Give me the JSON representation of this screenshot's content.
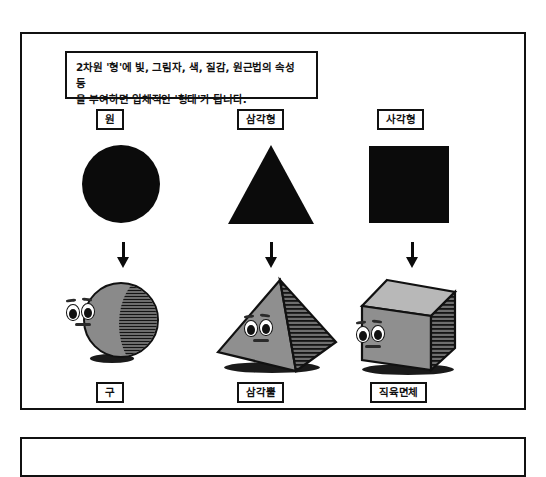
{
  "figure": {
    "caption": "2차원 '형'에 빛, 그림자, 색, 질감, 원근법의 속성 등\n을 부여하면 입체적인 '형태'가 됩니다.",
    "columns": [
      {
        "flat_label": "원",
        "flat_shape": "circle",
        "arrow": "arrow-down-icon",
        "solid_label": "구",
        "solid_shape": "sphere"
      },
      {
        "flat_label": "삼각형",
        "flat_shape": "triangle",
        "arrow": "arrow-down-icon",
        "solid_label": "삼각뿔",
        "solid_shape": "triangular-pyramid"
      },
      {
        "flat_label": "사각형",
        "flat_shape": "square",
        "arrow": "arrow-down-icon",
        "solid_label": "직육면체",
        "solid_shape": "rectangular-cuboid"
      }
    ]
  },
  "colors": {
    "ink": "#111111",
    "flat_fill": "#0b0b0b",
    "solid_light": "#b5b5b5",
    "solid_mid": "#8a8a8a",
    "solid_dark": "#3a3a3a",
    "paper": "#ffffff"
  }
}
